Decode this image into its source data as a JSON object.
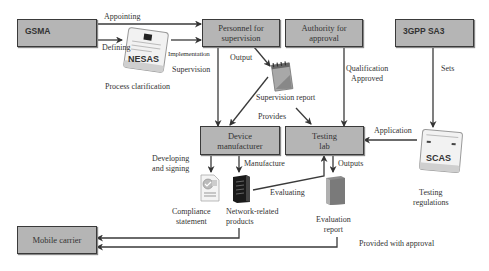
{
  "nodes": {
    "gsma": "GSMA",
    "personnel_l1": "Personnel for",
    "personnel_l2": "supervision",
    "authority_l1": "Authority for",
    "authority_l2": "approval",
    "sa3": "3GPP SA3",
    "device_l1": "Device",
    "device_l2": "manufacturer",
    "lab_l1": "Testing",
    "lab_l2": "lab",
    "carrier": "Mobile carrier"
  },
  "icons": {
    "nesas": "NESAS",
    "scas": "SCAS"
  },
  "labels": {
    "appointing": "Appointing",
    "defining": "Defining",
    "implementation": "Implementation",
    "supervision": "Supervision",
    "process_clarification": "Process clarification",
    "output": "Output",
    "supervision_report": "Supervision report",
    "qualification_l1": "Qualification",
    "qualification_l2": "Approved",
    "sets": "Sets",
    "provides": "Provides",
    "application": "Application",
    "developing_l1": "Developing",
    "developing_l2": "and signing",
    "manufacture": "Manufacture",
    "outputs": "Outputs",
    "evaluating": "Evaluating",
    "compliance_l1": "Compliance",
    "compliance_l2": "statement",
    "network_l1": "Network-related",
    "network_l2": "products",
    "evaluation_l1": "Evaluation",
    "evaluation_l2": "report",
    "testing_reg_l1": "Testing",
    "testing_reg_l2": "regulations",
    "provided_with_approval": "Provided with approval"
  },
  "colors": {
    "box_fill": "#b5b5b5",
    "box_border": "#3a3a3a",
    "line": "#3a3a3a"
  }
}
